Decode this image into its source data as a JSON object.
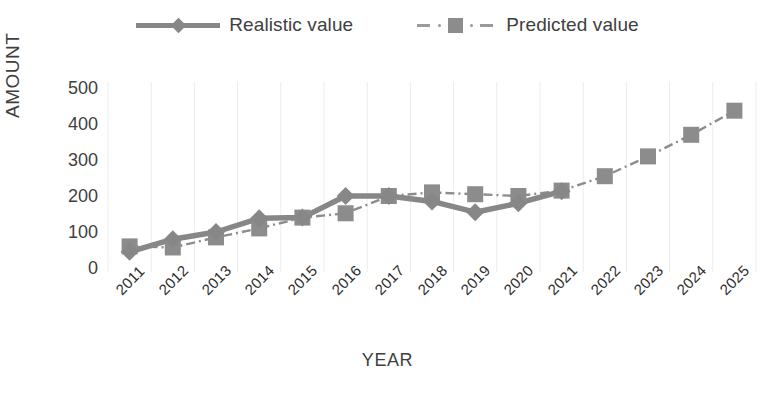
{
  "chart_data": {
    "type": "line",
    "title": "",
    "xlabel": "YEAR",
    "ylabel": "AMOUNT",
    "categories": [
      "2011",
      "2012",
      "2013",
      "2014",
      "2015",
      "2016",
      "2017",
      "2018",
      "2019",
      "2020",
      "2021",
      "2022",
      "2023",
      "2024",
      "2025"
    ],
    "yticks": [
      0,
      100,
      200,
      300,
      400,
      500
    ],
    "ylim": [
      0,
      500
    ],
    "grid": "vertical-only",
    "legend_position": "top-center",
    "series": [
      {
        "name": "Realistic value",
        "marker": "diamond",
        "linestyle": "solid",
        "color": "#878787",
        "x": [
          "2011",
          "2012",
          "2013",
          "2014",
          "2015",
          "2016",
          "2017",
          "2018",
          "2019",
          "2020",
          "2021"
        ],
        "values": [
          45,
          80,
          100,
          138,
          140,
          200,
          200,
          185,
          155,
          180,
          213
        ]
      },
      {
        "name": "Predicted value",
        "marker": "square",
        "linestyle": "dashdot",
        "color": "#8c8c8c",
        "x": [
          "2011",
          "2012",
          "2013",
          "2014",
          "2015",
          "2016",
          "2017",
          "2018",
          "2019",
          "2020",
          "2021",
          "2022",
          "2023",
          "2024",
          "2025"
        ],
        "values": [
          60,
          57,
          85,
          110,
          140,
          152,
          200,
          210,
          205,
          200,
          215,
          255,
          310,
          370,
          437
        ]
      }
    ]
  },
  "legend": {
    "items": [
      {
        "label": "Realistic value",
        "icon": "line-diamond-marker"
      },
      {
        "label": "Predicted value",
        "icon": "dashed-square-marker"
      }
    ]
  },
  "axes": {
    "y_title": "AMOUNT",
    "x_title": "YEAR"
  }
}
